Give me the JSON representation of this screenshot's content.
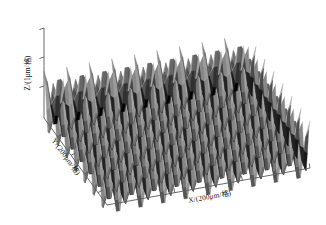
{
  "figure": {
    "background": "#ffffff",
    "ink_color": "#58585a",
    "text_color": "#141414"
  },
  "axes": {
    "x": {
      "name": "x-axis",
      "label": "X/(200μm/格)",
      "ticks": 5,
      "unit": "200μm",
      "per": "格"
    },
    "y": {
      "name": "y-axis",
      "label": "Y/(200μm/格)",
      "ticks": 4,
      "unit": "200μm",
      "per": "格"
    },
    "z": {
      "name": "z-axis",
      "label": "Z/(1μm/格)",
      "ticks": 3,
      "unit": "1μm",
      "per": "格"
    }
  },
  "chart_data": {
    "type": "heatmap",
    "render": "surface-3d",
    "title": "",
    "subtitle": "",
    "xlabel": "X/(200μm/格)",
    "ylabel": "Y/(200μm/格)",
    "zlabel": "Z/(1μm/格)",
    "colormap": "gray",
    "grid": false,
    "legend": null,
    "annotations": [],
    "surface": {
      "description": "periodic egg-carton microlens array, sinusoidal bumps in both x and y",
      "form": "z = A * cos(2*pi*x/period) * cos(2*pi*y/period)",
      "amplitude_um": 1.0,
      "period_um": 200,
      "nx_periods": 9,
      "ny_periods": 7,
      "xlim": [
        0,
        1800
      ],
      "ylim": [
        0,
        1400
      ],
      "zlim": [
        -1.0,
        1.0
      ],
      "x_tick_values": [
        0,
        200,
        400,
        600,
        800,
        1000
      ],
      "y_tick_values": [
        0,
        200,
        400,
        600,
        800
      ],
      "z_tick_values": [
        -1,
        0,
        1
      ],
      "shading": {
        "light_azimuth_deg": 315,
        "peak_gray": "#8c8c8c",
        "flank_light_gray": "#c9c9c9",
        "flank_dark_gray": "#5a5a5a",
        "valley_gray": "#1e1e1e"
      },
      "view": {
        "azimuth_deg": -42,
        "elevation_deg": 28
      }
    }
  }
}
